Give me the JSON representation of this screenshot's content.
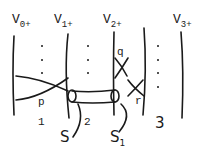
{
  "diagram": {
    "vertex_labels": [
      {
        "base": "V",
        "sub": "0+"
      },
      {
        "base": "V",
        "sub": "1+"
      },
      {
        "base": "V",
        "sub": "2+"
      },
      {
        "base": "V",
        "sub": "3+"
      }
    ],
    "region_labels": [
      "1",
      "2",
      "3"
    ],
    "crossing_labels": [
      "p",
      "q",
      "r"
    ],
    "surface_labels": {
      "s": "S",
      "s1_base": "S",
      "s1_sub": "1"
    }
  }
}
